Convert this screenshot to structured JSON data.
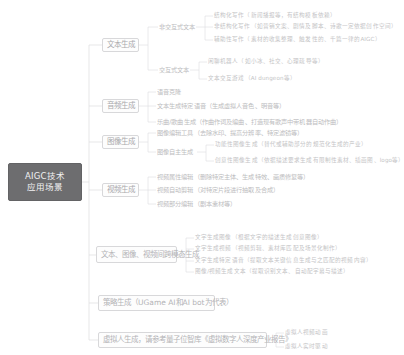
{
  "diagram": {
    "type": "mind-map",
    "orientation": "left-to-right",
    "colors": {
      "root_background": "#6d6d6f",
      "root_text": "#f2f2f3",
      "node_border": "#d8d8da",
      "branch_line": "#dcdcde",
      "text": "#b9b9bb",
      "page_background": "#ffffff"
    }
  },
  "root": {
    "line1": "AIGC技术",
    "line2": "应用场景"
  },
  "branches": [
    {
      "id": "text-generation",
      "label": "文本生成",
      "children": [
        {
          "id": "non-interactive-text",
          "label": "非交互式文本",
          "children": [
            {
              "id": "structured-writing",
              "label": "结构化写作（新闻播报等，有结构模板依赖）"
            },
            {
              "id": "unstructured-writing",
              "label": "非结构化写作（如营销文案、剧情及脚本、诗歌一定依据创作空间）"
            },
            {
              "id": "assisted-writing",
              "label": "辅助性写作（素材的收集整理、触发性的、千篇一律的AIGC）"
            }
          ]
        },
        {
          "id": "interactive-text",
          "label": "交互式文本",
          "children": [
            {
              "id": "chatbot-access",
              "label": "闲聊机器人（如小冰、社交、心理疏导等）"
            },
            {
              "id": "text-interactive-game",
              "label": "文本交互游戏（AI dungeon等）"
            }
          ]
        }
      ]
    },
    {
      "id": "audio-generation",
      "label": "音频生成",
      "children": [
        {
          "id": "tts",
          "label": "语音克隆"
        },
        {
          "id": "text-to-speech",
          "label": "文本生成特定语音（生成虚拟人音色、明音等）"
        },
        {
          "id": "music-generation",
          "label": "乐曲/歌曲生成（作曲作词及编曲、打造现有歌声中带机器自动作曲）"
        }
      ]
    },
    {
      "id": "image-generation",
      "label": "图像生成",
      "children": [
        {
          "id": "image-editing-tools",
          "label": "图像编辑工具（去除水印、提高分辨率、特定滤镜等）"
        },
        {
          "id": "image-autonomous-generation",
          "label": "图像自主生成",
          "children": [
            {
              "id": "function-image",
              "label": "功能性图像生成（替代或辅助部分的规范化生成的产业）"
            },
            {
              "id": "creative-image",
              "label": "创意性图像生成（依据描述要求生成有限制性素材、插画图、logo等）"
            }
          ]
        }
      ]
    },
    {
      "id": "video-generation",
      "label": "视频生成",
      "children": [
        {
          "id": "video-editing",
          "label": "视频属性编辑（删除特定主体、生成特效、画质修复等）"
        },
        {
          "id": "video-partial-edit",
          "label": "视频自动剪辑（对特定片段进行抽取及合成）"
        },
        {
          "id": "video-auto-generate",
          "label": "视频部分编辑（剧本素材等）"
        }
      ]
    },
    {
      "id": "cross-modal-generation",
      "label": "文本、图像、视频间跨模态生成",
      "children": [
        {
          "id": "text-to-image",
          "label": "文字生成图像（根据文字的描述生成创意图像）"
        },
        {
          "id": "text-to-video",
          "label": "文字生成视频（视频剪辑、素材库匹配及场景化制作）"
        },
        {
          "id": "text-to-audio",
          "label": "文字生成特定语音（提取文本关键信息生成与之匹配的视频内容）"
        },
        {
          "id": "image-video-to-text",
          "label": "图像/视频生成文本（提取识别文本、自动配字幕与描述）"
        }
      ]
    },
    {
      "id": "strategy-generation",
      "label": "策略生成（UGame AI和AI bot为代表）",
      "children": []
    },
    {
      "id": "virtual-human-generation",
      "label": "虚拟人生成，请参考量子位智库《虚拟数字人深度产业报告》",
      "children": [
        {
          "id": "vh-capture-driven",
          "label": "虚拟人视频动画"
        },
        {
          "id": "vh-realtime",
          "label": "虚拟人实时驱动"
        }
      ]
    }
  ]
}
